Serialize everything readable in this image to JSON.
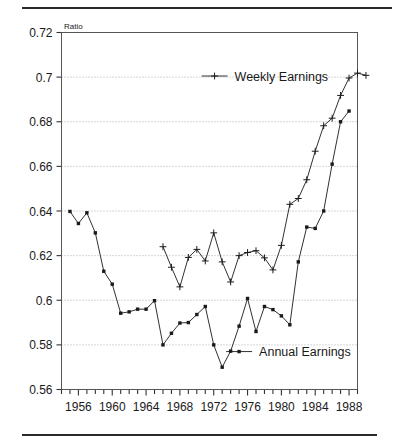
{
  "figure": {
    "has_top_rule": true,
    "has_bottom_rule": true,
    "rule_color": "#2b2b2b",
    "background": "#ffffff"
  },
  "chart_data": {
    "type": "line",
    "title": "",
    "subtitle": "",
    "xlabel": "",
    "ylabel": "Ratio",
    "ylabel_position": "top-left-above-axis",
    "xlim": [
      1954,
      1989
    ],
    "ylim": [
      0.56,
      0.72
    ],
    "yticks": [
      0.56,
      0.58,
      0.6,
      0.62,
      0.64,
      0.66,
      0.68,
      0.7,
      0.72
    ],
    "ytick_labels": [
      "0.56",
      "0.58",
      "0.6",
      "0.62",
      "0.64",
      "0.66",
      "0.68",
      "0.7",
      "0.72"
    ],
    "xticks": [
      1956,
      1960,
      1964,
      1968,
      1972,
      1976,
      1980,
      1984,
      1988
    ],
    "xtick_labels": [
      "1956",
      "1960",
      "1964",
      "1968",
      "1972",
      "1976",
      "1980",
      "1984",
      "1988"
    ],
    "x_minor_tick_step": 1,
    "grid": "horizontal-dotted",
    "grid_color": "#9a9a9a",
    "frame": true,
    "line_color": "#1a1a1a",
    "legend_position": "inside",
    "series": [
      {
        "name": "Weekly Earnings",
        "marker": "plus",
        "legend_x": 1972.1,
        "legend_y": 0.7005,
        "points": [
          {
            "x": 1966,
            "y": 0.624
          },
          {
            "x": 1967,
            "y": 0.6148
          },
          {
            "x": 1968,
            "y": 0.606
          },
          {
            "x": 1969,
            "y": 0.6192
          },
          {
            "x": 1970,
            "y": 0.6228
          },
          {
            "x": 1971,
            "y": 0.6176
          },
          {
            "x": 1972,
            "y": 0.6302
          },
          {
            "x": 1973,
            "y": 0.6172
          },
          {
            "x": 1974,
            "y": 0.6082
          },
          {
            "x": 1975,
            "y": 0.62
          },
          {
            "x": 1976,
            "y": 0.6214
          },
          {
            "x": 1977,
            "y": 0.6222
          },
          {
            "x": 1978,
            "y": 0.619
          },
          {
            "x": 1979,
            "y": 0.6136
          },
          {
            "x": 1980,
            "y": 0.6246
          },
          {
            "x": 1981,
            "y": 0.643
          },
          {
            "x": 1982,
            "y": 0.6456
          },
          {
            "x": 1983,
            "y": 0.654
          },
          {
            "x": 1984,
            "y": 0.6668
          },
          {
            "x": 1985,
            "y": 0.6782
          },
          {
            "x": 1986,
            "y": 0.6816
          },
          {
            "x": 1987,
            "y": 0.6918
          },
          {
            "x": 1988,
            "y": 0.6996
          },
          {
            "x": 1989,
            "y": 0.7018
          },
          {
            "x": 1990,
            "y": 0.7008
          }
        ]
      },
      {
        "name": "Annual Earnings",
        "marker": "square",
        "legend_x": 1975.0,
        "legend_y": 0.577,
        "points": [
          {
            "x": 1955,
            "y": 0.6398
          },
          {
            "x": 1956,
            "y": 0.6344
          },
          {
            "x": 1957,
            "y": 0.6392
          },
          {
            "x": 1958,
            "y": 0.6302
          },
          {
            "x": 1959,
            "y": 0.613
          },
          {
            "x": 1960,
            "y": 0.6072
          },
          {
            "x": 1961,
            "y": 0.5942
          },
          {
            "x": 1962,
            "y": 0.5948
          },
          {
            "x": 1963,
            "y": 0.596
          },
          {
            "x": 1964,
            "y": 0.596
          },
          {
            "x": 1965,
            "y": 0.5998
          },
          {
            "x": 1966,
            "y": 0.58
          },
          {
            "x": 1967,
            "y": 0.5852
          },
          {
            "x": 1968,
            "y": 0.5898
          },
          {
            "x": 1969,
            "y": 0.59
          },
          {
            "x": 1970,
            "y": 0.5936
          },
          {
            "x": 1971,
            "y": 0.5972
          },
          {
            "x": 1972,
            "y": 0.58
          },
          {
            "x": 1973,
            "y": 0.57
          },
          {
            "x": 1974,
            "y": 0.5772
          },
          {
            "x": 1975,
            "y": 0.5884
          },
          {
            "x": 1976,
            "y": 0.6008
          },
          {
            "x": 1977,
            "y": 0.586
          },
          {
            "x": 1978,
            "y": 0.5972
          },
          {
            "x": 1979,
            "y": 0.5958
          },
          {
            "x": 1980,
            "y": 0.593
          },
          {
            "x": 1981,
            "y": 0.589
          },
          {
            "x": 1982,
            "y": 0.6172
          },
          {
            "x": 1983,
            "y": 0.6328
          },
          {
            "x": 1984,
            "y": 0.6322
          },
          {
            "x": 1985,
            "y": 0.64
          },
          {
            "x": 1986,
            "y": 0.661
          },
          {
            "x": 1987,
            "y": 0.68
          },
          {
            "x": 1988,
            "y": 0.6848
          }
        ]
      }
    ]
  }
}
